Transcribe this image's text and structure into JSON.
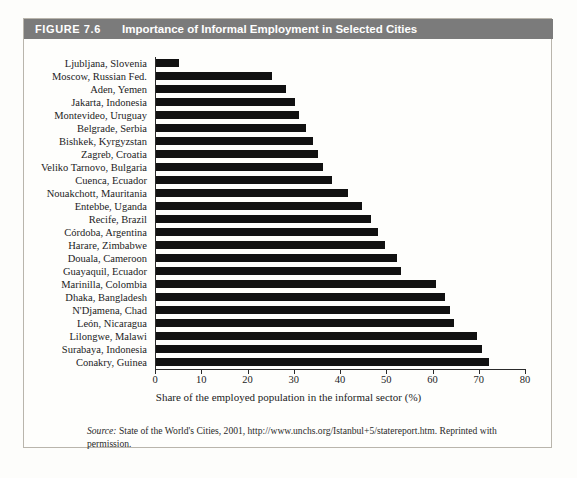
{
  "figure": {
    "number_label": "FIGURE 7.6",
    "title": "Importance of Informal Employment in Selected Cities",
    "header_bg": "#7b7b7b",
    "header_text_color": "#ffffff",
    "bar_color": "#111111",
    "page_bg": "#fdfdfb"
  },
  "source": {
    "prefix": "Source:",
    "text": "State of the World's Cities, 2001, http://www.unchs.org/Istanbul+5/statereport.htm. Reprinted with permission."
  },
  "chart_data": {
    "type": "bar",
    "orientation": "horizontal",
    "title": "Importance of Informal Employment in Selected Cities",
    "xlabel": "Share of the employed population in the informal sector (%)",
    "ylabel": "",
    "xlim": [
      0,
      80
    ],
    "xticks": [
      0,
      10,
      20,
      30,
      40,
      50,
      60,
      70,
      80
    ],
    "grid": false,
    "legend": false,
    "categories": [
      "Ljubljana, Slovenia",
      "Moscow, Russian Fed.",
      "Aden, Yemen",
      "Jakarta, Indonesia",
      "Montevideo, Uruguay",
      "Belgrade, Serbia",
      "Bishkek, Kyrgyzstan",
      "Zagreb, Croatia",
      "Veliko Tarnovo, Bulgaria",
      "Cuenca, Ecuador",
      "Nouakchott, Mauritania",
      "Entebbe, Uganda",
      "Recife, Brazil",
      "Córdoba, Argentina",
      "Harare, Zimbabwe",
      "Douala, Cameroon",
      "Guayaquil, Ecuador",
      "Marinilla, Colombia",
      "Dhaka, Bangladesh",
      "N'Djamena, Chad",
      "León, Nicaragua",
      "Lilongwe, Malawi",
      "Surabaya, Indonesia",
      "Conakry, Guinea"
    ],
    "values": [
      5.0,
      25.0,
      28.0,
      30.0,
      31.0,
      32.5,
      34.0,
      35.0,
      36.0,
      38.0,
      41.5,
      44.5,
      46.5,
      48.0,
      49.5,
      52.0,
      53.0,
      60.5,
      62.5,
      63.5,
      64.5,
      69.5,
      70.5,
      72.0
    ]
  }
}
